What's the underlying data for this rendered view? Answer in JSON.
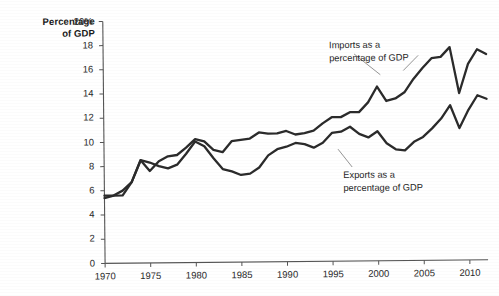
{
  "chart_data": {
    "type": "line",
    "title": "",
    "ylabel": "Percentage of GDP",
    "xlabel": "",
    "ylim": [
      0,
      20
    ],
    "xlim": [
      1970,
      2012
    ],
    "yticks": [
      0,
      2,
      4,
      6,
      8,
      10,
      12,
      14,
      16,
      18,
      20
    ],
    "ytick_labels": [
      "0",
      "2",
      "4",
      "6",
      "8",
      "10",
      "12",
      "14",
      "16",
      "18",
      "20%"
    ],
    "xticks": [
      1970,
      1975,
      1980,
      1985,
      1990,
      1995,
      2000,
      2005,
      2010
    ],
    "xtick_labels": [
      "1970",
      "1975",
      "1980",
      "1985",
      "1990",
      "1995",
      "2000",
      "2005",
      "2010"
    ],
    "grid": false,
    "legend_position": "inline-annotation",
    "line_color": "#2b2b2b",
    "x": [
      1970,
      1971,
      1972,
      1973,
      1974,
      1975,
      1976,
      1977,
      1978,
      1979,
      1980,
      1981,
      1982,
      1983,
      1984,
      1985,
      1986,
      1987,
      1988,
      1989,
      1990,
      1991,
      1992,
      1993,
      1994,
      1995,
      1996,
      1997,
      1998,
      1999,
      2000,
      2001,
      2002,
      2003,
      2004,
      2005,
      2006,
      2007,
      2008,
      2009,
      2010,
      2011,
      2012
    ],
    "series": [
      {
        "name": "Imports as a percentage of GDP",
        "values": [
          5.4,
          5.6,
          6.0,
          6.7,
          8.5,
          7.6,
          8.4,
          8.8,
          8.9,
          9.5,
          10.2,
          10.0,
          9.3,
          9.1,
          10.0,
          10.1,
          10.2,
          10.7,
          10.6,
          10.6,
          10.8,
          10.5,
          10.6,
          10.8,
          11.4,
          11.9,
          11.9,
          12.3,
          12.3,
          13.1,
          14.4,
          13.2,
          13.4,
          13.9,
          15.0,
          15.9,
          16.7,
          16.8,
          17.6,
          13.8,
          16.2,
          17.4,
          17.0
        ]
      },
      {
        "name": "Exports as a percentage of GDP",
        "values": [
          5.6,
          5.6,
          5.6,
          6.7,
          8.5,
          8.3,
          8.0,
          7.8,
          8.1,
          9.0,
          10.0,
          9.6,
          8.6,
          7.7,
          7.5,
          7.2,
          7.3,
          7.8,
          8.8,
          9.3,
          9.5,
          9.8,
          9.7,
          9.4,
          9.8,
          10.6,
          10.7,
          11.1,
          10.5,
          10.2,
          10.7,
          9.7,
          9.2,
          9.1,
          9.8,
          10.2,
          10.9,
          11.7,
          12.8,
          10.9,
          12.4,
          13.6,
          13.3
        ]
      }
    ],
    "annotations": [
      {
        "name": "imports-annotation",
        "text": "Imports as a\npercentage of GDP",
        "x": 1999,
        "y": 18.0
      },
      {
        "name": "exports-annotation",
        "text": "Exports as a\npercentage of GDP",
        "x": 1999,
        "y": 7.6
      }
    ]
  },
  "axis": {
    "y_title_line1": "Percentage",
    "y_title_line2": "of GDP"
  }
}
